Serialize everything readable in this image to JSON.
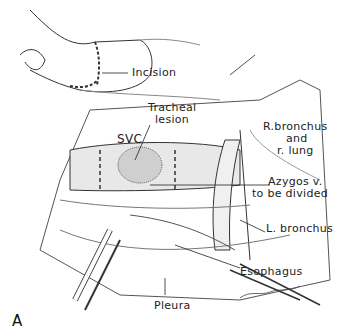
{
  "figure": {
    "panel_label": "A",
    "labels": {
      "incision": "Incision",
      "tracheal_lesion_1": "Tracheal",
      "tracheal_lesion_2": "lesion",
      "svc": "SVC",
      "r_bronchus_1": "R.bronchus",
      "r_bronchus_2": "and",
      "r_bronchus_3": "r. lung",
      "azygos_1": "Azygos v.",
      "azygos_2": "to be divided",
      "l_bronchus": "L. bronchus",
      "esophagus": "Esophagus",
      "pleura": "Pleura"
    },
    "colors": {
      "ink": "#222222",
      "background": "#ffffff",
      "shade": "#bdbdbd"
    }
  }
}
